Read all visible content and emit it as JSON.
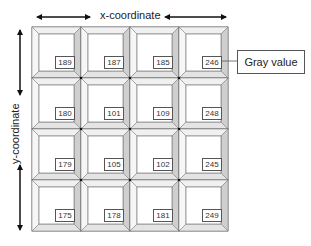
{
  "diagram": {
    "x_axis_label": "x-coordinate",
    "y_axis_label": "y-coordinate",
    "callout_label": "Gray value",
    "grid": {
      "rows": 4,
      "cols": 4,
      "values": [
        [
          189,
          187,
          185,
          246
        ],
        [
          180,
          101,
          109,
          248
        ],
        [
          179,
          105,
          102,
          245
        ],
        [
          175,
          178,
          181,
          249
        ]
      ]
    },
    "colors": {
      "line": "#555555",
      "bevel_light": "#f2f2f2",
      "bevel_dark": "#cfcfcf",
      "background": "#ffffff"
    }
  },
  "cells": {
    "r0c0": "189",
    "r0c1": "187",
    "r0c2": "185",
    "r0c3": "246",
    "r1c0": "180",
    "r1c1": "101",
    "r1c2": "109",
    "r1c3": "248",
    "r2c0": "179",
    "r2c1": "105",
    "r2c2": "102",
    "r2c3": "245",
    "r3c0": "175",
    "r3c1": "178",
    "r3c2": "181",
    "r3c3": "249"
  }
}
